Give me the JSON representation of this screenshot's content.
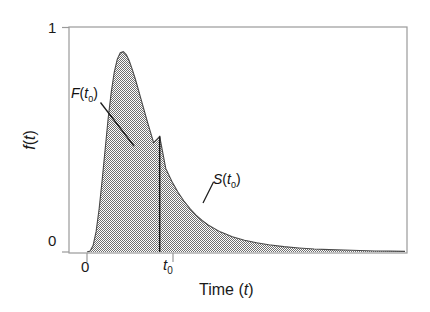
{
  "figure": {
    "width": 430,
    "height": 312,
    "background": "#ffffff",
    "fill_color": "#9a9a9a",
    "line_color": "#3a3a3a",
    "axis_color": "#8a8a8a"
  },
  "axes": {
    "y_title": "f(t)",
    "y_title_plain": "f",
    "y_title_var": "t",
    "x_title": "Time (t)",
    "x_title_plain": "Time (",
    "x_title_var": "t",
    "x_title_close": ")",
    "y_ticks": [
      "1",
      "0"
    ],
    "y_tick_top": "1",
    "y_tick_bottom": "0",
    "x_tick_origin": "0",
    "x_tick_t0_base": "t",
    "x_tick_t0_sub": "0"
  },
  "annotations": {
    "cdf_label_base": "F",
    "cdf_label_open": "(",
    "cdf_label_var": "t",
    "cdf_label_sub": "0",
    "cdf_label_close": ")",
    "surv_label_base": "S",
    "surv_label_open": "(",
    "surv_label_var": "t",
    "surv_label_sub": "0",
    "surv_label_close": ")"
  },
  "chart_data": {
    "type": "area",
    "title": "",
    "xlabel": "Time (t)",
    "ylabel": "f(t)",
    "grid": false,
    "legend": "none",
    "xlim": [
      0,
      10.5
    ],
    "ylim": [
      0,
      1.05
    ],
    "x_tick_values": [
      0,
      2.4
    ],
    "x_tick_labels": [
      "0",
      "t₀"
    ],
    "y_tick_values": [
      0,
      1
    ],
    "y_tick_labels": [
      "0",
      "1"
    ],
    "series": [
      {
        "name": "f(t)",
        "x": [
          0.0,
          0.1,
          0.2,
          0.3,
          0.4,
          0.5,
          0.6,
          0.7,
          0.8,
          0.9,
          1.0,
          1.1,
          1.2,
          1.3,
          1.4,
          1.5,
          1.6,
          1.7,
          1.8,
          1.9,
          2.0,
          2.2,
          2.4,
          2.6,
          2.8,
          3.0,
          3.2,
          3.4,
          3.6,
          3.8,
          4.0,
          4.4,
          4.8,
          5.2,
          5.6,
          6.0,
          6.5,
          7.0,
          7.5,
          8.0,
          8.5,
          9.0,
          9.5,
          10.0,
          10.5
        ],
        "y": [
          0.0,
          0.004,
          0.03,
          0.095,
          0.2,
          0.335,
          0.48,
          0.625,
          0.745,
          0.84,
          0.9,
          0.93,
          0.935,
          0.92,
          0.89,
          0.85,
          0.805,
          0.755,
          0.705,
          0.655,
          0.605,
          0.51,
          0.54,
          0.39,
          0.33,
          0.28,
          0.238,
          0.202,
          0.172,
          0.147,
          0.126,
          0.094,
          0.071,
          0.055,
          0.043,
          0.034,
          0.025,
          0.019,
          0.014,
          0.011,
          0.009,
          0.007,
          0.005,
          0.004,
          0.003
        ]
      }
    ],
    "reference_line": {
      "name": "t0",
      "orientation": "vertical",
      "x": 2.4,
      "y_from": 0.0,
      "y_to": 0.54
    },
    "regions": [
      {
        "label": "F(t0)",
        "x_from": 0.0,
        "x_to": 2.4,
        "meaning": "cumulative distribution function up to t0"
      },
      {
        "label": "S(t0)",
        "x_from": 2.4,
        "x_to": 10.5,
        "meaning": "survivor function beyond t0"
      }
    ],
    "peak": {
      "x": 1.18,
      "y": 0.935
    },
    "value_at_t0": 0.54
  }
}
